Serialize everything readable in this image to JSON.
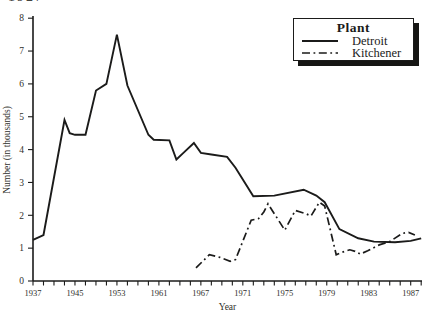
{
  "page": {
    "clipped_top_text": "1927"
  },
  "colors": {
    "line_ink": "#1b1b1a",
    "text_ink": "#30302b",
    "paper": "#ffffff",
    "legend_shadow": "#161614"
  },
  "chart_data": {
    "type": "line",
    "title": "",
    "xlabel": "Year",
    "ylabel": "Number (in thousands)",
    "x_tick_labels": [
      "1937",
      "1945",
      "1953",
      "1961",
      "1967",
      "1971",
      "1975",
      "1979",
      "1983",
      "1987"
    ],
    "x_anchor_years": [
      1937,
      1945,
      1953,
      1961,
      1967,
      1971,
      1975,
      1979,
      1983,
      1987
    ],
    "minor_ticks_per_label_gap": 4,
    "ylim": [
      0,
      8
    ],
    "y_tick_values": [
      0,
      1,
      2,
      3,
      4,
      5,
      6,
      7,
      8
    ],
    "grid": "off",
    "legend": {
      "title": "Plant",
      "position": "top-right",
      "entries": [
        {
          "label": "Detroit",
          "style": "solid"
        },
        {
          "label": "Kitchener",
          "style": "dash-dot"
        }
      ]
    },
    "series": [
      {
        "name": "Detroit",
        "style": "solid",
        "points": [
          [
            1937,
            1.25
          ],
          [
            1939,
            1.4
          ],
          [
            1943,
            4.9
          ],
          [
            1944,
            4.5
          ],
          [
            1945,
            4.45
          ],
          [
            1947,
            4.45
          ],
          [
            1949,
            5.8
          ],
          [
            1951,
            6.0
          ],
          [
            1953,
            7.5
          ],
          [
            1955,
            5.95
          ],
          [
            1959,
            4.45
          ],
          [
            1960,
            4.3
          ],
          [
            1962.5,
            4.28
          ],
          [
            1963.5,
            3.7
          ],
          [
            1964.5,
            3.9
          ],
          [
            1966,
            4.2
          ],
          [
            1967,
            3.9
          ],
          [
            1968,
            3.85
          ],
          [
            1969.5,
            3.78
          ],
          [
            1970.3,
            3.45
          ],
          [
            1972,
            2.58
          ],
          [
            1974,
            2.6
          ],
          [
            1976.8,
            2.78
          ],
          [
            1978,
            2.6
          ],
          [
            1978.8,
            2.4
          ],
          [
            1980.2,
            1.58
          ],
          [
            1982,
            1.3
          ],
          [
            1983.5,
            1.2
          ],
          [
            1985.5,
            1.18
          ],
          [
            1987,
            1.22
          ],
          [
            1988,
            1.3
          ]
        ]
      },
      {
        "name": "Kitchener",
        "style": "dash-dot",
        "points": [
          [
            1966.3,
            0.4
          ],
          [
            1967.8,
            0.8
          ],
          [
            1968.8,
            0.72
          ],
          [
            1969.8,
            0.6
          ],
          [
            1970.3,
            0.65
          ],
          [
            1971.8,
            1.85
          ],
          [
            1972.5,
            1.9
          ],
          [
            1973,
            2.1
          ],
          [
            1973.4,
            2.35
          ],
          [
            1975,
            1.55
          ],
          [
            1976,
            2.15
          ],
          [
            1977,
            2.05
          ],
          [
            1977.5,
            1.98
          ],
          [
            1978.3,
            2.4
          ],
          [
            1978.8,
            2.28
          ],
          [
            1979.9,
            0.8
          ],
          [
            1980.4,
            0.87
          ],
          [
            1981.2,
            0.95
          ],
          [
            1981.7,
            0.9
          ],
          [
            1982.2,
            0.82
          ],
          [
            1982.9,
            0.92
          ],
          [
            1984,
            1.1
          ],
          [
            1985,
            1.2
          ],
          [
            1986.2,
            1.45
          ],
          [
            1986.8,
            1.48
          ],
          [
            1987.4,
            1.4
          ]
        ]
      }
    ]
  }
}
